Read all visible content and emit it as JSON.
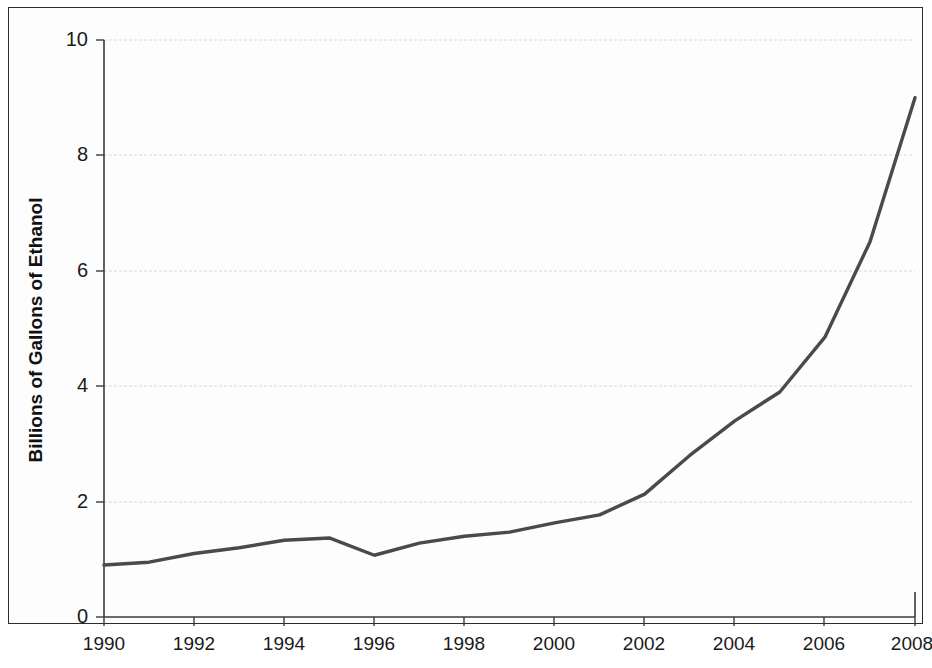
{
  "chart_data": {
    "type": "line",
    "title": "",
    "subtitle": "",
    "xlabel": "",
    "ylabel": "Billions of Gallons of Ethanol",
    "x": [
      1990,
      1991,
      1992,
      1993,
      1994,
      1995,
      1996,
      1997,
      1998,
      1999,
      2000,
      2001,
      2002,
      2003,
      2004,
      2005,
      2006,
      2007,
      2008
    ],
    "values": [
      0.9,
      0.95,
      1.1,
      1.2,
      1.33,
      1.37,
      1.07,
      1.28,
      1.4,
      1.47,
      1.63,
      1.77,
      2.13,
      2.8,
      3.4,
      3.9,
      4.85,
      6.5,
      9.0
    ],
    "series": [
      {
        "name": "Ethanol Production",
        "values": [
          0.9,
          0.95,
          1.1,
          1.2,
          1.33,
          1.37,
          1.07,
          1.28,
          1.4,
          1.47,
          1.63,
          1.77,
          2.13,
          2.8,
          3.4,
          3.9,
          4.85,
          6.5,
          9.0
        ],
        "color": "#4a4a4a"
      }
    ],
    "xlim": [
      1990,
      2008
    ],
    "ylim": [
      0,
      10
    ],
    "ytick_labels": [
      "0",
      "2",
      "4",
      "6",
      "8",
      "10"
    ],
    "ytick_values": [
      0,
      2,
      4,
      6,
      8,
      10
    ],
    "xtick_labels": [
      "1990",
      "1992",
      "1994",
      "1996",
      "1998",
      "2000",
      "2002",
      "2004",
      "2006",
      "2008"
    ],
    "xtick_values": [
      1990,
      1992,
      1994,
      1996,
      1998,
      2000,
      2002,
      2004,
      2006,
      2008
    ],
    "grid": "horizontal",
    "legend": "none",
    "colors": {
      "line": "#4a4a4a",
      "gridline": "#d8d8d8",
      "axis": "#3a3a3a",
      "text": "#1a1a1a",
      "background": "#fdfdfd",
      "frame": "#2c2c2c"
    }
  }
}
